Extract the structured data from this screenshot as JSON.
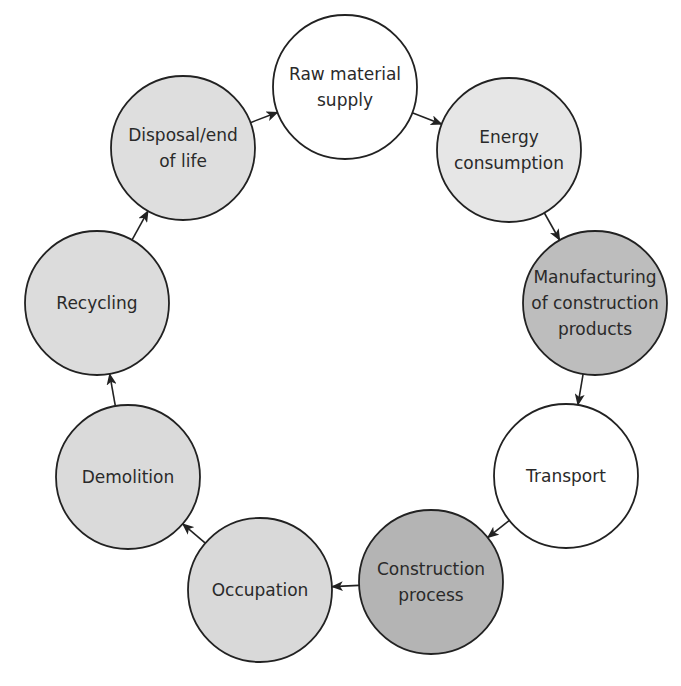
{
  "diagram": {
    "type": "cycle",
    "colors": {
      "white": "#ffffff",
      "light": "#e4e4e4",
      "medium": "#d6d6d6",
      "dark": "#b9b9b9",
      "stroke": "#222222"
    },
    "nodes": [
      {
        "id": "raw-material-supply",
        "lines": [
          "Raw material",
          "supply"
        ],
        "cx": 345,
        "cy": 87,
        "fill": "#ffffff"
      },
      {
        "id": "energy-consumption",
        "lines": [
          "Energy",
          "consumption"
        ],
        "cx": 509,
        "cy": 150,
        "fill": "#e6e6e6"
      },
      {
        "id": "manufacturing",
        "lines": [
          "Manufacturing",
          "of construction",
          "products"
        ],
        "cx": 595,
        "cy": 303,
        "fill": "#bdbdbd"
      },
      {
        "id": "transport",
        "lines": [
          "Transport"
        ],
        "cx": 566,
        "cy": 476,
        "fill": "#ffffff"
      },
      {
        "id": "construction-process",
        "lines": [
          "Construction",
          "process"
        ],
        "cx": 431,
        "cy": 582,
        "fill": "#b4b4b4"
      },
      {
        "id": "occupation",
        "lines": [
          "Occupation"
        ],
        "cx": 260,
        "cy": 590,
        "fill": "#d9d9d9"
      },
      {
        "id": "demolition",
        "lines": [
          "Demolition"
        ],
        "cx": 128,
        "cy": 477,
        "fill": "#dadada"
      },
      {
        "id": "recycling",
        "lines": [
          "Recycling"
        ],
        "cx": 97,
        "cy": 303,
        "fill": "#dcdcdc"
      },
      {
        "id": "disposal-end-of-life",
        "lines": [
          "Disposal/end",
          "of life"
        ],
        "cx": 183,
        "cy": 148,
        "fill": "#dedede"
      }
    ],
    "radius": 72,
    "edges": [
      {
        "from": "raw-material-supply",
        "to": "energy-consumption"
      },
      {
        "from": "energy-consumption",
        "to": "manufacturing"
      },
      {
        "from": "manufacturing",
        "to": "transport"
      },
      {
        "from": "transport",
        "to": "construction-process"
      },
      {
        "from": "construction-process",
        "to": "occupation"
      },
      {
        "from": "occupation",
        "to": "demolition"
      },
      {
        "from": "demolition",
        "to": "recycling"
      },
      {
        "from": "recycling",
        "to": "disposal-end-of-life"
      },
      {
        "from": "disposal-end-of-life",
        "to": "raw-material-supply"
      }
    ]
  }
}
